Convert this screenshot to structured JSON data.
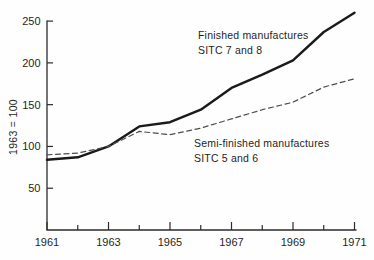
{
  "chart_data": {
    "type": "line",
    "x": [
      1961,
      1962,
      1963,
      1964,
      1965,
      1966,
      1967,
      1968,
      1969,
      1970,
      1971
    ],
    "series": [
      {
        "name": "Finished manufactures SITC 7 and 8",
        "label_line1": "Finished manufactures",
        "label_line2": "SITC 7 and 8",
        "style": "solid",
        "color": "#1a1a1a",
        "values": [
          84,
          87,
          100,
          124,
          129,
          144,
          170,
          186,
          203,
          237,
          260
        ]
      },
      {
        "name": "Semi-finished manufactures SITC 5 and 6",
        "label_line1": "Semi-finished manufactures",
        "label_line2": "SITC 5 and 6",
        "style": "dashed",
        "color": "#4d4d4d",
        "values": [
          90,
          92,
          100,
          118,
          114,
          122,
          133,
          144,
          153,
          171,
          181
        ]
      }
    ],
    "title": "",
    "xlabel": "",
    "ylabel": "1963 = 100",
    "ylim": [
      0,
      260
    ],
    "yticks": [
      50,
      100,
      150,
      200,
      250
    ],
    "xtick_labels": [
      "1961",
      "1963",
      "1965",
      "1967",
      "1969",
      "1971"
    ],
    "xticks_minor": [
      1962,
      1964,
      1966,
      1968,
      1970
    ],
    "grid": false,
    "legend_position": "inline-annotations",
    "axis_color": "#2b2b2b",
    "text_color": "#1f1f1f",
    "background_color": "#fefefe"
  }
}
